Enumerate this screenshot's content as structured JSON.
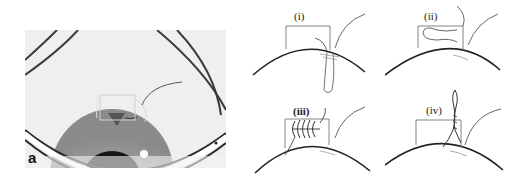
{
  "figure": {
    "photo_label": "a",
    "panels": [
      {
        "label": "(i)",
        "description": "suture loop passing through tissue"
      },
      {
        "label": "(ii)",
        "description": "suture loop laid flat in box"
      },
      {
        "label": "(iii)",
        "description": "suture wound into coils in box"
      },
      {
        "label": "(iv)",
        "description": "suture twisted and pulled upward"
      }
    ],
    "colors": {
      "line": "#333333",
      "photo_bg": "#eeeeee",
      "iris": "#9a9a9a",
      "pupil": "#1a1a1a"
    }
  }
}
